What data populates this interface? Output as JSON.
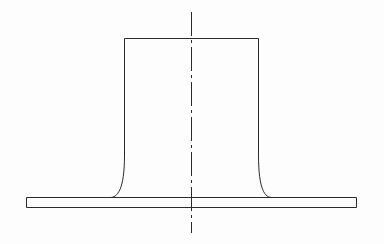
{
  "drawing": {
    "title": "Sectional view of a flanged boss / pedestal",
    "domain_label": "engineering-drawing",
    "view_type": "cross-section",
    "background_color": "#fdfdfd",
    "line_color": "#2a2a2a",
    "line_width": 1,
    "canvas": {
      "width": 384,
      "height": 244
    },
    "parts": [
      {
        "name": "base-plate",
        "label": "Base plate",
        "shape": "rectangle",
        "x_left": 26,
        "x_right": 357,
        "y_top": 197,
        "y_bottom": 208,
        "thickness": 11,
        "width": 331
      },
      {
        "name": "vertical-boss",
        "label": "Vertical boss",
        "shape": "column-with-fillets",
        "top_y": 38,
        "top_x_left": 124,
        "top_x_right": 259,
        "wall_straight_end_y": 155,
        "fillet_base_x_left": 110,
        "fillet_base_x_right": 272,
        "base_y": 197,
        "width_at_top": 135,
        "height": 159
      }
    ],
    "centerline": {
      "name": "vertical-centerline",
      "label": "Centerline",
      "x": 191,
      "y_top": 12,
      "y_bottom": 233,
      "style": "dash-dot",
      "dash_pattern": "24 4 3 4"
    }
  }
}
